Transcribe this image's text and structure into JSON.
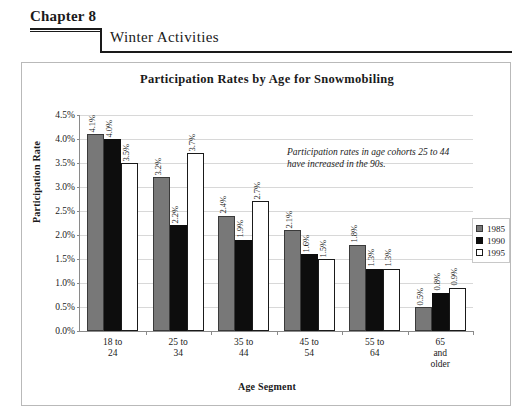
{
  "header": {
    "chapter": "Chapter 8",
    "section_title": "Winter Activities"
  },
  "chart_data": {
    "type": "bar",
    "title": "Participation Rates by Age for Snowmobiling",
    "xlabel": "Age Segment",
    "ylabel": "Participation Rate",
    "ylim": [
      0,
      4.5
    ],
    "ytick_labels": [
      "0.0%",
      "0.5%",
      "1.0%",
      "1.5%",
      "2.0%",
      "2.5%",
      "3.0%",
      "3.5%",
      "4.0%",
      "4.5%"
    ],
    "ytick_values": [
      0,
      0.5,
      1.0,
      1.5,
      2.0,
      2.5,
      3.0,
      3.5,
      4.0,
      4.5
    ],
    "grid": true,
    "legend_position": "right",
    "categories": [
      "18 to 24",
      "25 to 34",
      "35 to 44",
      "45 to 54",
      "55 to 64",
      "65 and older"
    ],
    "category_lines": [
      [
        "18 to",
        "24"
      ],
      [
        "25 to",
        "34"
      ],
      [
        "35 to",
        "44"
      ],
      [
        "45 to",
        "54"
      ],
      [
        "55 to",
        "64"
      ],
      [
        "65",
        "and",
        "older"
      ]
    ],
    "series": [
      {
        "name": "1985",
        "color": "#787878",
        "values": [
          4.1,
          3.2,
          2.4,
          2.1,
          1.8,
          0.5
        ],
        "labels": [
          "4.1%",
          "3.2%",
          "2.4%",
          "2.1%",
          "1.8%",
          "0.5%"
        ]
      },
      {
        "name": "1990",
        "color": "#0d0d0d",
        "values": [
          4.0,
          2.2,
          1.9,
          1.6,
          1.3,
          0.8
        ],
        "labels": [
          "4.0%",
          "2.2%",
          "1.9%",
          "1.6%",
          "1.3%",
          "0.8%"
        ]
      },
      {
        "name": "1995",
        "color": "#ffffff",
        "values": [
          3.5,
          3.7,
          2.7,
          1.5,
          1.3,
          0.9
        ],
        "labels": [
          "3.5%",
          "3.7%",
          "2.7%",
          "1.5%",
          "1.3%",
          "0.9%"
        ]
      }
    ],
    "annotation": "Participation rates in age cohorts 25 to 44 have increased in the 90s."
  }
}
